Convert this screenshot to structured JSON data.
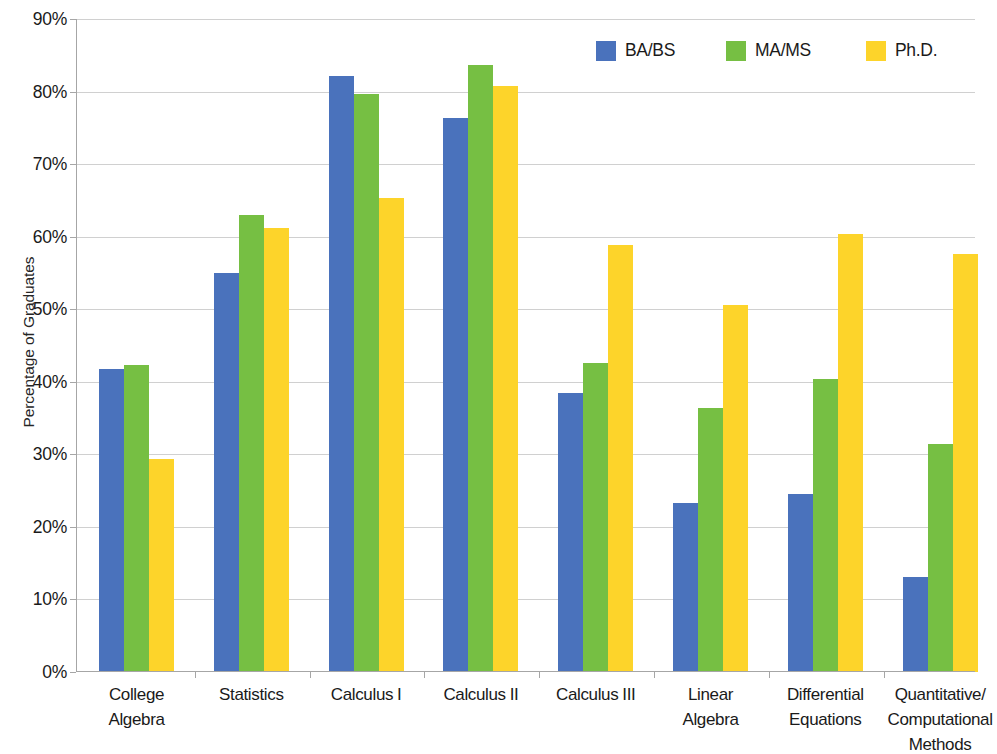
{
  "chart_data": {
    "type": "bar",
    "title": "",
    "xlabel": "",
    "ylabel": "Percentage of Graduates",
    "ylim": [
      0,
      90
    ],
    "ytick_labels": [
      "0%",
      "10%",
      "20%",
      "30%",
      "40%",
      "50%",
      "60%",
      "70%",
      "80%",
      "90%"
    ],
    "ytick_values": [
      0,
      10,
      20,
      30,
      40,
      50,
      60,
      70,
      80,
      90
    ],
    "grid": true,
    "legend_position": "top-right",
    "categories": [
      "College Algebra",
      "Statistics",
      "Calculus I",
      "Calculus II",
      "Calculus III",
      "Linear Algebra",
      "Differential Equations",
      "Quantitative/ Computational Methods"
    ],
    "category_lines": [
      [
        "College",
        "Algebra"
      ],
      [
        "Statistics"
      ],
      [
        "Calculus I"
      ],
      [
        "Calculus II"
      ],
      [
        "Calculus III"
      ],
      [
        "Linear",
        "Algebra"
      ],
      [
        "Differential",
        "Equations"
      ],
      [
        "Quantitative/",
        "Computational",
        "Methods"
      ]
    ],
    "series": [
      {
        "name": "BA/BS",
        "color": "#4a72bc",
        "values": [
          41.7,
          55.0,
          82.1,
          76.3,
          38.5,
          23.3,
          24.6,
          13.1
        ]
      },
      {
        "name": "MA/MS",
        "color": "#76bf43",
        "values": [
          42.3,
          63.0,
          79.6,
          83.7,
          42.6,
          36.4,
          40.4,
          31.4
        ]
      },
      {
        "name": "Ph.D.",
        "color": "#fdd42a",
        "values": [
          29.3,
          61.2,
          65.4,
          80.8,
          58.8,
          50.6,
          60.4,
          57.6
        ]
      }
    ]
  },
  "legend": {
    "entries": [
      {
        "label": "BA/BS"
      },
      {
        "label": "MA/MS"
      },
      {
        "label": "Ph.D."
      }
    ]
  }
}
